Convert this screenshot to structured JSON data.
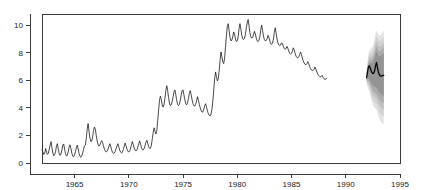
{
  "chart_data": {
    "type": "line",
    "title": "",
    "subtitle": "",
    "xlabel": "",
    "ylabel": "",
    "xlim": [
      1962.0,
      1995.0
    ],
    "ylim": [
      0,
      10.8
    ],
    "grid": false,
    "legend": "none",
    "x_ticks": [
      1965,
      1970,
      1975,
      1980,
      1985,
      1990,
      1995
    ],
    "x_tick_labels": [
      "1965",
      "1970",
      "1975",
      "1980",
      "1985",
      "1990",
      "1995"
    ],
    "y_ticks": [
      0,
      2,
      4,
      6,
      8,
      10
    ],
    "y_tick_labels": [
      "0",
      "2",
      "4",
      "6",
      "8",
      "10"
    ],
    "series": [
      {
        "name": "observed",
        "type": "line",
        "color": "#1a1a1a",
        "x_start": 1962.0,
        "x_step": 0.08333,
        "values": [
          0.95,
          0.8,
          0.62,
          0.72,
          1.05,
          0.8,
          0.62,
          0.7,
          1.0,
          1.3,
          1.55,
          1.1,
          0.72,
          0.52,
          0.62,
          0.8,
          1.25,
          1.4,
          1.0,
          0.7,
          0.55,
          0.65,
          0.95,
          1.3,
          1.38,
          1.0,
          0.68,
          0.5,
          0.58,
          0.8,
          1.15,
          1.32,
          1.05,
          0.72,
          0.5,
          0.45,
          0.58,
          0.82,
          1.1,
          1.3,
          1.02,
          0.7,
          0.48,
          0.42,
          0.52,
          0.72,
          1.0,
          1.25,
          1.3,
          1.8,
          2.45,
          2.85,
          2.3,
          1.8,
          1.55,
          1.6,
          1.9,
          2.35,
          2.6,
          2.45,
          2.0,
          1.6,
          1.35,
          1.22,
          1.3,
          1.48,
          1.62,
          1.5,
          1.25,
          1.02,
          0.88,
          0.8,
          0.85,
          1.0,
          1.2,
          1.4,
          1.2,
          0.95,
          0.78,
          0.7,
          0.72,
          0.85,
          1.05,
          1.25,
          1.4,
          1.15,
          0.92,
          0.78,
          0.72,
          0.8,
          0.98,
          1.22,
          1.45,
          1.25,
          1.0,
          0.85,
          0.8,
          0.88,
          1.08,
          1.32,
          1.55,
          1.32,
          1.08,
          0.92,
          0.88,
          0.95,
          1.15,
          1.38,
          1.6,
          1.38,
          1.12,
          0.98,
          0.95,
          1.05,
          1.25,
          1.5,
          1.65,
          1.42,
          1.18,
          1.05,
          1.08,
          1.3,
          1.75,
          2.2,
          2.55,
          2.3,
          2.1,
          2.35,
          3.05,
          3.85,
          4.55,
          4.85,
          4.6,
          4.2,
          4.05,
          4.25,
          4.7,
          5.25,
          5.6,
          5.25,
          4.75,
          4.35,
          4.15,
          4.22,
          4.45,
          4.8,
          5.15,
          5.3,
          4.95,
          4.55,
          4.25,
          4.15,
          4.25,
          4.55,
          4.95,
          5.25,
          5.3,
          4.95,
          4.58,
          4.3,
          4.22,
          4.35,
          4.68,
          5.05,
          5.25,
          4.95,
          4.6,
          4.3,
          4.15,
          4.12,
          4.25,
          4.5,
          4.8,
          4.55,
          4.25,
          4.0,
          3.8,
          3.68,
          3.72,
          3.9,
          4.15,
          4.3,
          4.05,
          3.78,
          3.58,
          3.45,
          3.42,
          3.55,
          3.9,
          4.5,
          5.3,
          6.1,
          6.6,
          6.25,
          5.95,
          6.1,
          6.7,
          7.45,
          8.05,
          7.7,
          7.3,
          7.2,
          7.6,
          8.4,
          9.25,
          9.9,
          10.1,
          9.6,
          9.1,
          8.85,
          8.9,
          9.15,
          9.5,
          9.35,
          9.0,
          8.8,
          8.85,
          9.15,
          9.75,
          10.1,
          9.7,
          9.25,
          9.0,
          8.95,
          9.05,
          9.3,
          9.8,
          10.15,
          10.4,
          9.95,
          9.45,
          9.15,
          9.05,
          9.1,
          9.3,
          9.55,
          9.35,
          9.05,
          8.85,
          8.8,
          8.9,
          9.15,
          9.65,
          10.0,
          9.6,
          9.2,
          8.95,
          8.85,
          8.88,
          9.0,
          9.25,
          9.1,
          8.85,
          8.65,
          8.6,
          8.7,
          9.0,
          9.45,
          9.8,
          9.4,
          9.0,
          8.7,
          8.55,
          8.5,
          8.55,
          8.7,
          8.65,
          8.45,
          8.3,
          8.25,
          8.3,
          8.45,
          8.3,
          8.1,
          7.95,
          7.9,
          7.95,
          8.1,
          8.35,
          8.2,
          7.95,
          7.75,
          7.65,
          7.62,
          7.7,
          7.85,
          8.05,
          7.85,
          7.6,
          7.4,
          7.25,
          7.15,
          7.12,
          7.2,
          7.35,
          7.2,
          7.0,
          6.85,
          6.75,
          6.7,
          6.72,
          6.8,
          6.95,
          6.8,
          6.6,
          6.45,
          6.35,
          6.28,
          6.25,
          6.28,
          6.35,
          6.2,
          6.1,
          6.05,
          6.08,
          6.15
        ]
      },
      {
        "name": "forecast-median",
        "type": "line",
        "color": "#000000",
        "x_start": 1991.9167,
        "x_step": 0.08333,
        "values": [
          6.18,
          6.55,
          6.95,
          7.05,
          6.9,
          6.7,
          6.55,
          6.48,
          6.52,
          6.7,
          7.05,
          7.3,
          6.95,
          6.62,
          6.42,
          6.32,
          6.3,
          6.32,
          6.35,
          6.36
        ]
      }
    ],
    "forecast_fan": {
      "description": "nested prediction-interval bands, widening with horizon",
      "x_start": 1991.9167,
      "x_step": 0.08333,
      "n_steps": 20,
      "band_levels": [
        "50%",
        "70%",
        "80%",
        "90%",
        "95%"
      ],
      "band_colors": [
        "#9a9a9a",
        "#b0b0b0",
        "#c2c2c2",
        "#d2d2d2",
        "#e0e0e0"
      ],
      "bands": [
        {
          "level": "95%",
          "color": "#e2e2e2",
          "upper": [
            6.55,
            7.25,
            7.85,
            8.15,
            8.25,
            8.3,
            8.35,
            8.45,
            8.7,
            9.0,
            9.35,
            9.6,
            9.45,
            9.3,
            9.25,
            9.25,
            9.3,
            9.4,
            9.5,
            9.6
          ],
          "lower": [
            5.85,
            5.55,
            5.4,
            5.2,
            4.95,
            4.7,
            4.45,
            4.25,
            4.1,
            4.0,
            3.95,
            3.85,
            3.65,
            3.45,
            3.25,
            3.1,
            2.98,
            2.9,
            2.85,
            2.8
          ]
        },
        {
          "level": "90%",
          "color": "#d2d2d2",
          "upper": [
            6.48,
            7.1,
            7.62,
            7.88,
            7.95,
            7.98,
            8.02,
            8.12,
            8.35,
            8.62,
            8.95,
            9.18,
            9.02,
            8.88,
            8.82,
            8.82,
            8.86,
            8.95,
            9.05,
            9.15
          ],
          "lower": [
            5.92,
            5.7,
            5.6,
            5.45,
            5.22,
            5.0,
            4.78,
            4.6,
            4.48,
            4.4,
            4.36,
            4.28,
            4.1,
            3.92,
            3.75,
            3.62,
            3.52,
            3.45,
            3.4,
            3.36
          ]
        },
        {
          "level": "80%",
          "color": "#c0c0c0",
          "upper": [
            6.4,
            6.95,
            7.4,
            7.62,
            7.68,
            7.7,
            7.74,
            7.82,
            8.02,
            8.28,
            8.58,
            8.8,
            8.64,
            8.5,
            8.44,
            8.44,
            8.48,
            8.56,
            8.65,
            8.74
          ],
          "lower": [
            5.98,
            5.86,
            5.8,
            5.68,
            5.48,
            5.3,
            5.1,
            4.95,
            4.85,
            4.78,
            4.75,
            4.68,
            4.52,
            4.36,
            4.22,
            4.1,
            4.02,
            3.96,
            3.92,
            3.88
          ]
        },
        {
          "level": "70%",
          "color": "#ababab",
          "upper": [
            6.32,
            6.82,
            7.22,
            7.4,
            7.45,
            7.46,
            7.5,
            7.58,
            7.76,
            8.0,
            8.28,
            8.48,
            8.32,
            8.18,
            8.12,
            8.12,
            8.16,
            8.23,
            8.31,
            8.4
          ],
          "lower": [
            6.04,
            5.98,
            5.96,
            5.86,
            5.7,
            5.54,
            5.38,
            5.24,
            5.16,
            5.1,
            5.08,
            5.02,
            4.88,
            4.74,
            4.62,
            4.52,
            4.45,
            4.4,
            4.36,
            4.33
          ]
        },
        {
          "level": "50%",
          "color": "#949494",
          "upper": [
            6.26,
            6.7,
            7.08,
            7.22,
            7.24,
            7.22,
            7.24,
            7.3,
            7.46,
            7.68,
            7.94,
            8.12,
            7.96,
            7.82,
            7.76,
            7.75,
            7.78,
            7.84,
            7.91,
            7.99
          ],
          "lower": [
            6.1,
            6.12,
            6.14,
            6.06,
            5.94,
            5.82,
            5.7,
            5.6,
            5.54,
            5.5,
            5.5,
            5.46,
            5.34,
            5.22,
            5.12,
            5.04,
            4.98,
            4.94,
            4.91,
            4.88
          ]
        }
      ]
    }
  },
  "plot_box": {
    "left": 42,
    "right": 400,
    "top": 14,
    "bottom": 163
  },
  "colors": {
    "axis": "#3b3b3b",
    "line": "#1a1a1a",
    "forecast": "#000000",
    "background": "#ffffff"
  }
}
